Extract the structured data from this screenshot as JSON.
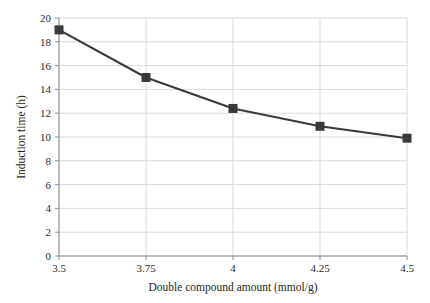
{
  "chart_data": {
    "type": "line",
    "title": "",
    "xlabel": "Double compound amount (mmol/g)",
    "ylabel": "Induction time (h)",
    "categories": [
      "3.5",
      "3.75",
      "4",
      "4.25",
      "4.5"
    ],
    "x": [
      3.5,
      3.75,
      4,
      4.25,
      4.5
    ],
    "values": [
      19.0,
      15.0,
      12.4,
      10.9,
      9.9
    ],
    "series": [
      {
        "name": "Induction time",
        "values": [
          19.0,
          15.0,
          12.4,
          10.9,
          9.9
        ],
        "marker": "filled-square",
        "color": "#3a3a3a"
      }
    ],
    "ylim": [
      0,
      20
    ],
    "ytick_labels": [
      "0",
      "2",
      "4",
      "6",
      "8",
      "10",
      "12",
      "14",
      "16",
      "18",
      "20"
    ],
    "ytick_values": [
      0,
      2,
      4,
      6,
      8,
      10,
      12,
      14,
      16,
      18,
      20
    ],
    "xtick_labels": [
      "3.5",
      "3.75",
      "4",
      "4.25",
      "4.5"
    ],
    "grid": {
      "horizontal": true,
      "vertical": true,
      "color": "#d9d9d9"
    },
    "legend": {
      "visible": false,
      "position": "none"
    },
    "colors": {
      "line": "#3a3a3a",
      "marker": "#3a3a3a",
      "grid": "#d9d9d9",
      "axis": "#9a9a9a",
      "text": "#231f20",
      "background": "#ffffff"
    }
  }
}
